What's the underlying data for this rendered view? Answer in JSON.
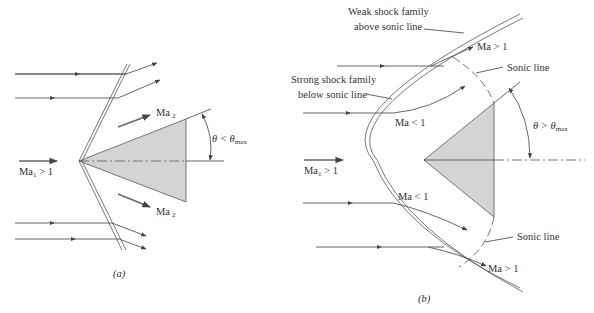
{
  "figure": {
    "panel_a": {
      "caption": "(a)",
      "freestream_label": "Ma",
      "freestream_sub": "1",
      "freestream_rel": " > 1",
      "upper_downstream_label": "Ma",
      "upper_downstream_sub": "2",
      "lower_downstream_label": "Ma",
      "lower_downstream_sub": "2",
      "angle_label": "θ < θ",
      "angle_sub": "max",
      "shock_type": "attached oblique shock"
    },
    "panel_b": {
      "caption": "(b)",
      "freestream_label": "Ma",
      "freestream_sub": "1",
      "freestream_rel": " > 1",
      "weak_shock_label_line1": "Weak shock family",
      "weak_shock_label_line2": "above sonic line",
      "strong_shock_label_line1": "Strong shock family",
      "strong_shock_label_line2": "below sonic line",
      "upper_supersonic": "Ma > 1",
      "upper_sonic_line": "Sonic line",
      "upper_subsonic": "Ma < 1",
      "lower_subsonic": "Ma < 1",
      "lower_sonic_line": "Sonic line",
      "lower_supersonic": "Ma > 1",
      "angle_label": "θ > θ",
      "angle_sub": "max",
      "shock_type": "detached bow shock"
    }
  }
}
